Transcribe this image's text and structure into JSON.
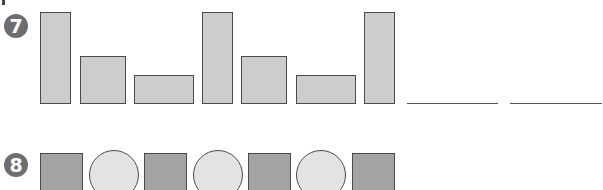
{
  "problems": [
    {
      "number": "7",
      "type": "bar-pattern",
      "pattern": [
        "tall",
        "medium",
        "short",
        "tall",
        "medium",
        "short",
        "tall"
      ],
      "blanks": 2
    },
    {
      "number": "8",
      "type": "shape-pattern",
      "pattern": [
        "square",
        "circle",
        "square",
        "circle",
        "square",
        "circle",
        "square"
      ]
    }
  ],
  "colors": {
    "bar_fill": "#cdcdcd",
    "square_fill": "#a3a3a3",
    "circle_fill": "#e3e3e3",
    "outline": "#4a4a4a",
    "badge": "#6e6e6e"
  }
}
